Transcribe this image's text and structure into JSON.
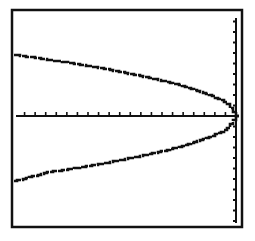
{
  "colors": {
    "background": "#ffffff",
    "ink": "#111111"
  },
  "frame": {
    "x0": 12,
    "y0": 10,
    "x1": 242,
    "y1": 227,
    "inner_x1": 239
  },
  "axes": {
    "x_axis_y_px": 116,
    "y_axis_x_px": 236,
    "x_tick_spacing_px": 10.5,
    "y_tick_spacing_px": 10.5
  },
  "chart_data": {
    "type": "line",
    "title": "",
    "xlabel": "",
    "ylabel": "",
    "xlim": [
      -21,
      0
    ],
    "ylim": [
      -10.5,
      10.5
    ],
    "grid": false,
    "legend": null,
    "x_tick_step": 1,
    "y_tick_step": 1,
    "series": [
      {
        "name": "upper branch",
        "x": [
          -21,
          -18,
          -15,
          -12,
          -9,
          -6,
          -3,
          -1,
          0
        ],
        "y": [
          5.8,
          5.4,
          4.9,
          4.4,
          3.8,
          3.1,
          2.2,
          1.3,
          0
        ]
      },
      {
        "name": "lower branch",
        "x": [
          -21,
          -18,
          -15,
          -12,
          -9,
          -6,
          -3,
          -1,
          0
        ],
        "y": [
          -6.2,
          -5.4,
          -4.9,
          -4.4,
          -3.8,
          -3.1,
          -2.2,
          -1.3,
          0
        ]
      }
    ]
  }
}
